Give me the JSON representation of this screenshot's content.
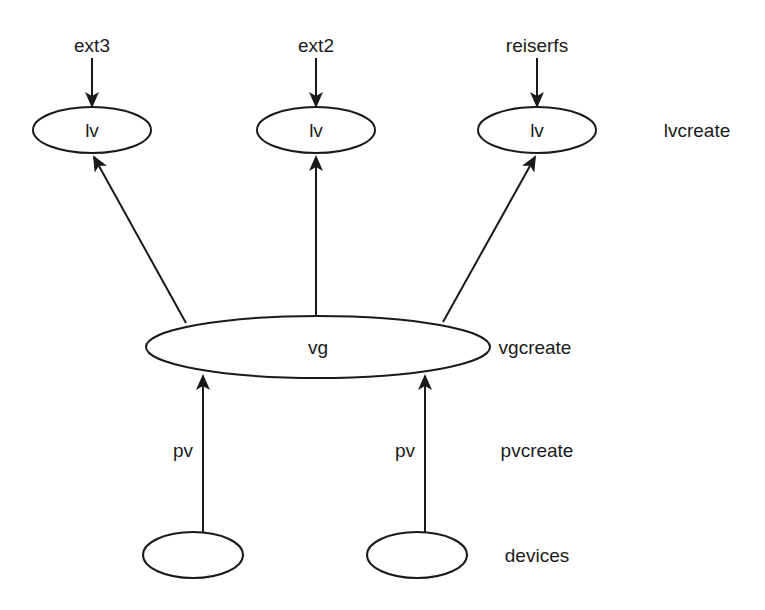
{
  "diagram": {
    "filesystems": [
      {
        "label": "ext3"
      },
      {
        "label": "ext2"
      },
      {
        "label": "reiserfs"
      }
    ],
    "logical_volumes": [
      {
        "label": "lv"
      },
      {
        "label": "lv"
      },
      {
        "label": "lv"
      }
    ],
    "volume_group": {
      "label": "vg"
    },
    "physical_volume_labels": [
      {
        "label": "pv"
      },
      {
        "label": "pv"
      }
    ],
    "devices": [
      {
        "label": ""
      },
      {
        "label": ""
      }
    ],
    "layer_labels": {
      "lv": "lvcreate",
      "vg": "vgcreate",
      "pv": "pvcreate",
      "devices": "devices"
    },
    "colors": {
      "stroke": "#1a1a1a",
      "background": "#ffffff"
    }
  }
}
